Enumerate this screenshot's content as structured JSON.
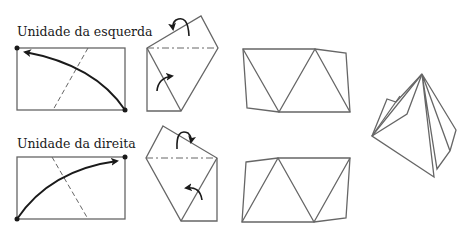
{
  "labels": {
    "left_unit": "Unidade da esquerda",
    "right_unit": "Unidade da direita"
  },
  "colors": {
    "line": "#666666",
    "arrow": "#1a1a1a",
    "text": "#1a1a1a"
  },
  "steps": [
    {
      "row": "left",
      "step": 1,
      "description": "rectangle with curved arrow from bottom-right corner to top-left corner, dashed crease"
    },
    {
      "row": "left",
      "step": 2,
      "description": "folded shape with dash-dot crease and two fold arrows"
    },
    {
      "row": "left",
      "step": 3,
      "description": "unit with triangle creases"
    },
    {
      "row": "right",
      "step": 1,
      "description": "rectangle with curved arrow from bottom-left corner to top-right corner, dashed crease"
    },
    {
      "row": "right",
      "step": 2,
      "description": "folded shape with dash-dot crease and two fold arrows"
    },
    {
      "row": "right",
      "step": 3,
      "description": "unit with triangle creases"
    },
    {
      "row": "both",
      "step": 4,
      "description": "assembled pyramid"
    }
  ]
}
